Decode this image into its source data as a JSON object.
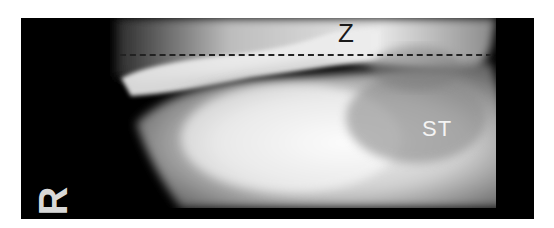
{
  "image": {
    "type": "radiograph",
    "labels": {
      "top": "Z",
      "right": "ST",
      "side_marker": "R"
    },
    "annotations": {
      "dashed_line": "horizontal reference line"
    },
    "colors": {
      "background": "#000000",
      "border": "#ffffff"
    }
  }
}
